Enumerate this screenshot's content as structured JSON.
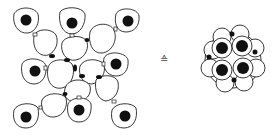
{
  "figure": {
    "left_panel": {
      "label": "dispersed cells",
      "nucleated_cells": [
        {
          "cx": 26,
          "cy": 20
        },
        {
          "cx": 72,
          "cy": 23
        },
        {
          "cx": 128,
          "cy": 21
        },
        {
          "cx": 35,
          "cy": 71
        },
        {
          "cx": 116,
          "cy": 64
        },
        {
          "cx": 26,
          "cy": 117
        },
        {
          "cx": 79,
          "cy": 110
        },
        {
          "cx": 125,
          "cy": 116
        }
      ],
      "anucleate_cells": [
        {
          "cx": 45,
          "cy": 42
        },
        {
          "cx": 73,
          "cy": 51
        },
        {
          "cx": 101,
          "cy": 43
        },
        {
          "cx": 60,
          "cy": 77
        },
        {
          "cx": 92,
          "cy": 73
        },
        {
          "cx": 77,
          "cy": 93
        },
        {
          "cx": 54,
          "cy": 107
        },
        {
          "cx": 108,
          "cy": 89
        }
      ]
    },
    "symbol": "≙",
    "right_panel": {
      "label": "compact aggregate",
      "center": {
        "cx": 233,
        "cy": 60
      },
      "large_nuclei": 4,
      "small_nuclei": 4
    },
    "colors": {
      "line": "#222222",
      "fill": "#111111",
      "background": "#ffffff"
    }
  }
}
